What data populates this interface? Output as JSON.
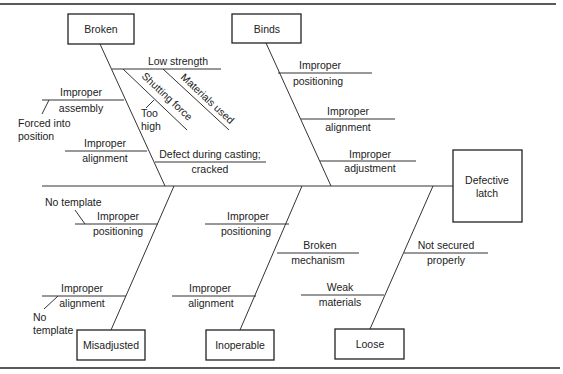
{
  "diagram": {
    "type": "fishbone",
    "effect": {
      "line1": "Defective",
      "line2": "latch"
    },
    "categories": {
      "broken": {
        "label": "Broken",
        "causes": [
          {
            "l1": "Low strength",
            "l2": ""
          },
          {
            "l1": "Materials used",
            "l2": ""
          },
          {
            "l1": "Shutting force",
            "l2": ""
          },
          {
            "l1": "Too",
            "l2": "high"
          },
          {
            "l1": "Improper",
            "l2": "assembly"
          },
          {
            "l1": "Forced into",
            "l2": "position"
          },
          {
            "l1": "Improper",
            "l2": "alignment"
          },
          {
            "l1": "Defect during casting;",
            "l2": "cracked"
          }
        ]
      },
      "binds": {
        "label": "Binds",
        "causes": [
          {
            "l1": "Improper",
            "l2": "positioning"
          },
          {
            "l1": "Improper",
            "l2": "alignment"
          },
          {
            "l1": "Improper",
            "l2": "adjustment"
          }
        ]
      },
      "misadjusted": {
        "label": "Misadjusted",
        "causes": [
          {
            "l1": "No template",
            "l2": ""
          },
          {
            "l1": "Improper",
            "l2": "positioning"
          },
          {
            "l1": "Improper",
            "l2": "alignment"
          },
          {
            "l1": "No",
            "l2": "template"
          }
        ]
      },
      "inoperable": {
        "label": "Inoperable",
        "causes": [
          {
            "l1": "Improper",
            "l2": "positioning"
          },
          {
            "l1": "Broken",
            "l2": "mechanism"
          },
          {
            "l1": "Improper",
            "l2": "alignment"
          }
        ]
      },
      "loose": {
        "label": "Loose",
        "causes": [
          {
            "l1": "Not secured",
            "l2": "properly"
          },
          {
            "l1": "Weak",
            "l2": "materials"
          }
        ]
      }
    }
  }
}
